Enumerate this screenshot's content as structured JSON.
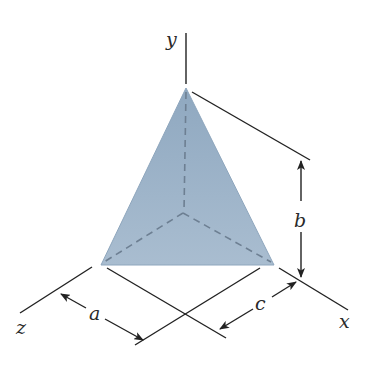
{
  "figure": {
    "type": "tetrahedron-dimension-diagram",
    "fill_color": "#9db3c8",
    "edge_color": "#8ea6bd",
    "line_color": "#222222",
    "hidden_edge_color": "#6d7f92",
    "axes": {
      "x_label": "x",
      "y_label": "y",
      "z_label": "z"
    },
    "dimensions": {
      "a_label": "a",
      "b_label": "b",
      "c_label": "c"
    }
  }
}
